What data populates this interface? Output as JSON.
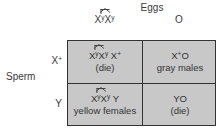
{
  "title": "Eggs",
  "side_label": "Sperm",
  "columns": [
    {
      "base": "XX",
      "sup": [
        "y",
        "y"
      ],
      "attached": true,
      "display": "X^yX^y (attached)"
    },
    {
      "base": "O",
      "display": "O"
    }
  ],
  "rows": [
    {
      "label": "X",
      "sup": "+",
      "display": "X+"
    },
    {
      "label": "Y",
      "display": "Y"
    }
  ],
  "cells": [
    [
      {
        "genotype": "X^yX^y X+",
        "phenotype": "(die)"
      },
      {
        "genotype": "X+O",
        "phenotype": "gray males"
      }
    ],
    [
      {
        "genotype": "X^yX^y Y",
        "phenotype": "yellow females"
      },
      {
        "genotype": "YO",
        "phenotype": "(die)"
      }
    ]
  ],
  "text": {
    "x": "X",
    "y_sup": "y",
    "plus_sup": "+",
    "o": "O",
    "y": "Y",
    "die": "(die)",
    "gray_males": "gray males",
    "yellow_females": "yellow females"
  },
  "colors": {
    "cell_fill": "#c8c8c8",
    "border": "#333333",
    "text": "#3a3a3a"
  }
}
